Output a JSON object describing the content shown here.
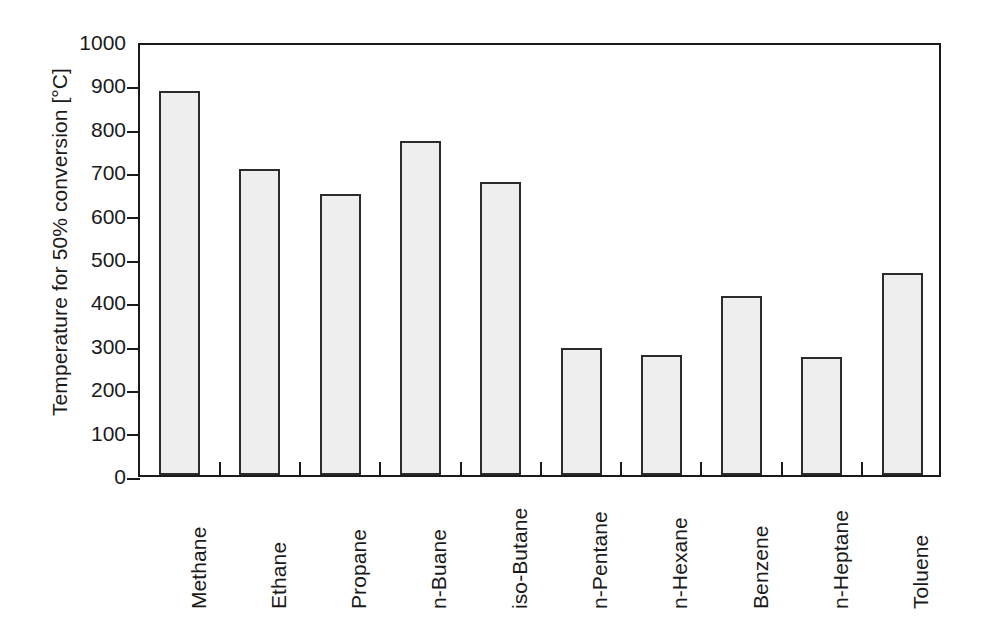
{
  "chart_data": {
    "type": "bar",
    "title": "",
    "xlabel": "",
    "ylabel": "Temperature for 50% conversion [°C]",
    "ylim": [
      0,
      1000
    ],
    "ytick_labels": [
      "0",
      "100",
      "200",
      "300",
      "400",
      "500",
      "600",
      "700",
      "800",
      "900",
      "1000"
    ],
    "ytick_values": [
      0,
      100,
      200,
      300,
      400,
      500,
      600,
      700,
      800,
      900,
      1000
    ],
    "grid": false,
    "legend": null,
    "categories": [
      "Methane",
      "Ethane",
      "Propane",
      "n-Buane",
      "iso-Butane",
      "n-Pentane",
      "n-Hexane",
      "Benzene",
      "n-Heptane",
      "Toluene"
    ],
    "values": [
      885,
      705,
      648,
      770,
      675,
      293,
      277,
      413,
      273,
      465
    ],
    "bar_fill_color": "#eeeeee",
    "bar_edge_color": "#2b2b2b",
    "axis_color": "#1a1a1a",
    "background_color": "#ffffff"
  }
}
